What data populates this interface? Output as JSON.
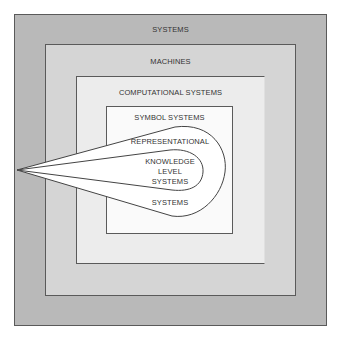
{
  "diagram": {
    "levels": [
      {
        "label": "SYSTEMS"
      },
      {
        "label": "MACHINES"
      },
      {
        "label": "COMPUTATIONAL SYSTEMS"
      },
      {
        "label": "SYMBOL SYSTEMS"
      }
    ],
    "teardrop_outer": {
      "label": "REPRESENTATIONAL",
      "label_bottom": "SYSTEMS"
    },
    "teardrop_inner": {
      "lines": [
        "KNOWLEDGE",
        "LEVEL",
        "SYSTEMS"
      ]
    }
  }
}
